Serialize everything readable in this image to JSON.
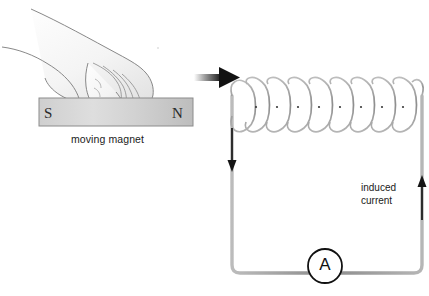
{
  "figure": {
    "background_color": "#ffffff",
    "width": 429,
    "height": 296
  },
  "left_panel": {
    "name": "moving-magnet-illustration",
    "caption": "moving magnet",
    "magnet": {
      "south_pole_label": "S",
      "north_pole_label": "N",
      "body_color": "#d6d6d6",
      "outline_color": "#8a8a8a"
    },
    "hand": {
      "description": "hand pushing magnet",
      "outline_color": "#7d7d7d",
      "fill_color": "#fbfbfb"
    }
  },
  "transition_arrow": {
    "name": "right-arrow",
    "direction": "right",
    "color": "#1a1a1a"
  },
  "right_panel": {
    "name": "induction-circuit",
    "coil": {
      "turns": 9,
      "wire_color": "#9a9a9a",
      "highlight_color": "#ffffff"
    },
    "current_label": {
      "line1": "induced",
      "line2": "current"
    },
    "ammeter": {
      "symbol": "A",
      "shape": "circle",
      "outline_color": "#111111"
    },
    "wires": {
      "color": "#9a9a9a",
      "left_arrow_direction": "down",
      "right_arrow_direction": "up",
      "arrow_color": "#1a1a1a"
    }
  },
  "colors": {
    "wire_gray": "#9a9a9a",
    "ink_black": "#1a1a1a",
    "magnet_gray": "#d6d6d6",
    "paper_white": "#ffffff"
  }
}
